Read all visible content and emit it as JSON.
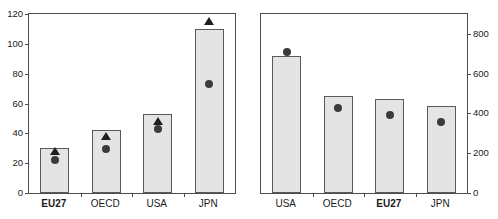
{
  "chart_data": [
    {
      "type": "bar",
      "panel": "left",
      "title": "Triadic patents",
      "subtitle": "Per million population",
      "xlabel": "",
      "ylabel": "",
      "ylim": [
        0,
        120
      ],
      "yticks": [
        0,
        20,
        40,
        60,
        80,
        100,
        120
      ],
      "axis_side": "left",
      "grid": false,
      "legend_position": "inside-top-left",
      "categories": [
        "EU27",
        "OECD",
        "USA",
        "JPN"
      ],
      "highlight_category": "EU27",
      "series": [
        {
          "name": "2006",
          "footnote": "1",
          "marker": "bar",
          "values": [
            30,
            42,
            53,
            110
          ]
        },
        {
          "name": "2000",
          "marker": "triangle",
          "values": [
            31,
            41,
            51,
            118
          ]
        },
        {
          "name": "1995",
          "marker": "circle",
          "values": [
            25,
            32.5,
            45.5,
            76
          ]
        }
      ]
    },
    {
      "type": "bar",
      "panel": "right",
      "title": "Scientific articles",
      "subtitle": "Per million population",
      "xlabel": "",
      "ylabel": "",
      "ylim": [
        0,
        900
      ],
      "yticks": [
        0,
        200,
        400,
        600,
        800
      ],
      "axis_side": "right",
      "grid": false,
      "legend_position": "inside-top-center",
      "categories": [
        "USA",
        "OECD",
        "EU27",
        "JPN"
      ],
      "highlight_category": "EU27",
      "series": [
        {
          "name": "2005",
          "marker": "bar",
          "values": [
            690,
            490,
            475,
            435
          ]
        },
        {
          "name": "1995",
          "marker": "circle",
          "values": [
            730,
            445,
            410,
            375
          ]
        }
      ]
    }
  ],
  "colors": {
    "bar_fill": "#e4e4e4",
    "bar_border": "#5a5a5a",
    "marker": "#3b3b3b",
    "axis": "#4d4d4d",
    "text": "#1a1a1a",
    "background": "#ffffff"
  }
}
